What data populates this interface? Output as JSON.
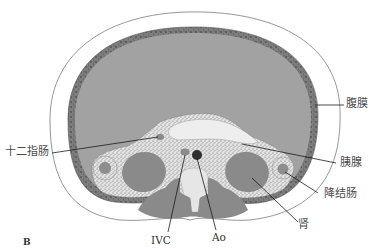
{
  "figure": {
    "panel_letter": "B",
    "colors": {
      "background": "#ffffff",
      "peritoneal_cavity": "#9e9e9e",
      "peritoneum_wall": "#7c7c7c",
      "retroperitoneal_fat": "#e4e4e4",
      "organ_gray": "#8a8a8a",
      "vessel_dark": "#2e2e2e",
      "outline": "#555555",
      "leader_line": "#1a1a1a"
    }
  },
  "labels": {
    "peritoneum": "腹膜",
    "pancreas": "胰腺",
    "descending_colon": "降结肠",
    "kidney": "肾",
    "duodenum": "十二指肠",
    "ivc": "IVC",
    "aorta": "Ao"
  }
}
